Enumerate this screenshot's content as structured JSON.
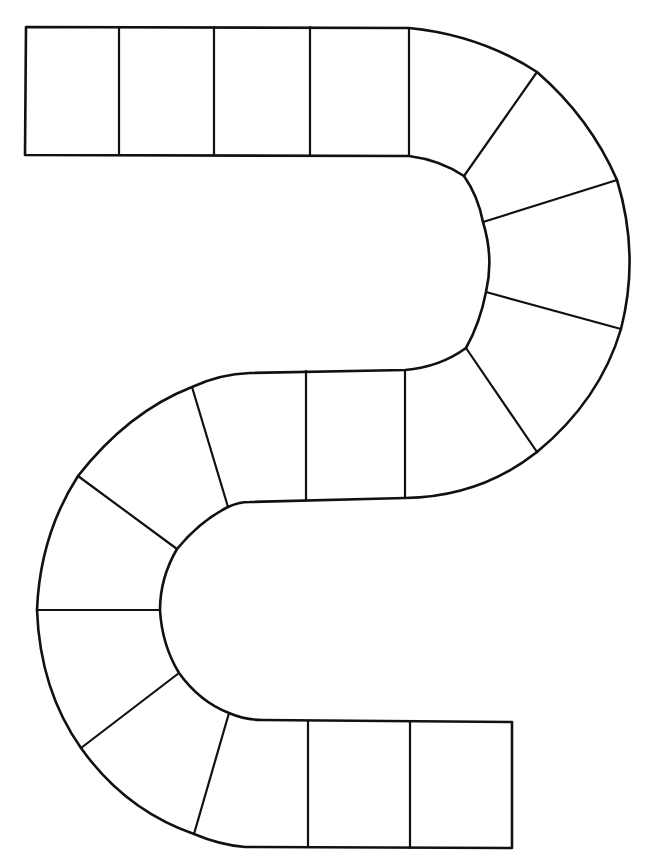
{
  "board": {
    "type": "blank S-shaped board game path",
    "background_color": "#ffffff",
    "line_color": "#111111",
    "space_count": 19,
    "sections": [
      {
        "name": "top-straight",
        "spaces": 4
      },
      {
        "name": "right-curve",
        "spaces": 5
      },
      {
        "name": "middle-straight",
        "spaces": 3
      },
      {
        "name": "left-curve",
        "spaces": 5
      },
      {
        "name": "bottom-straight",
        "spaces": 2
      }
    ]
  }
}
